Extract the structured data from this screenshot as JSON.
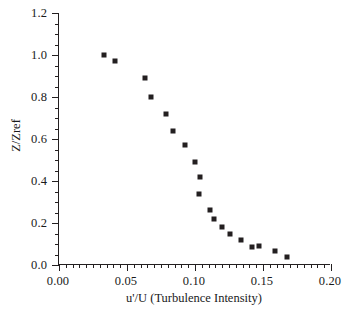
{
  "chart_data": {
    "type": "scatter",
    "title": "",
    "xlabel": "u'/U (Turbulence Intensity)",
    "ylabel": "Z/Zref",
    "xlim": [
      0.0,
      0.2
    ],
    "ylim": [
      0.0,
      1.2
    ],
    "xticks": [
      0.0,
      0.05,
      0.1,
      0.15,
      0.2
    ],
    "yticks": [
      0.0,
      0.2,
      0.4,
      0.6,
      0.8,
      1.0,
      1.2
    ],
    "xtick_labels": [
      "0.00",
      "0.05",
      "0.10",
      "0.15",
      "0.20"
    ],
    "ytick_labels": [
      "0.0",
      "0.2",
      "0.4",
      "0.6",
      "0.8",
      "1.0",
      "1.2"
    ],
    "x_minor_per_major": 10,
    "y_minor_per_major": 4,
    "grid": false,
    "legend": null,
    "marker": "square",
    "marker_color": "#231f20",
    "series": [
      {
        "name": "Turbulence intensity profile",
        "x": [
          0.033,
          0.041,
          0.063,
          0.068,
          0.079,
          0.084,
          0.093,
          0.1,
          0.104,
          0.103,
          0.111,
          0.114,
          0.12,
          0.126,
          0.134,
          0.142,
          0.147,
          0.159,
          0.168
        ],
        "y": [
          1.0,
          0.97,
          0.89,
          0.8,
          0.72,
          0.64,
          0.57,
          0.49,
          0.42,
          0.34,
          0.26,
          0.22,
          0.18,
          0.15,
          0.12,
          0.085,
          0.09,
          0.065,
          0.04
        ]
      }
    ]
  },
  "axes": {
    "x_title": "u'/U (Turbulence Intensity)",
    "y_title": "Z/Zref"
  }
}
